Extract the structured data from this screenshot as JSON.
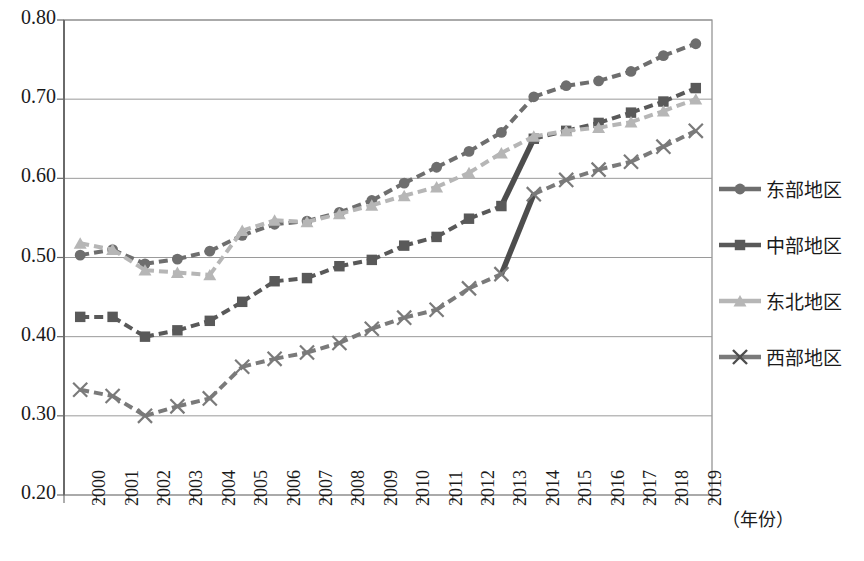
{
  "chart_data": {
    "type": "line",
    "title": "",
    "xlabel": "（年份）",
    "ylabel": "",
    "ylim": [
      0.2,
      0.8
    ],
    "ytick_step": 0.1,
    "grid": true,
    "legend_position": "right",
    "categories": [
      "2000",
      "2001",
      "2002",
      "2003",
      "2004",
      "2005",
      "2006",
      "2007",
      "2008",
      "2009",
      "2010",
      "2011",
      "2012",
      "2013",
      "2014",
      "2015",
      "2016",
      "2017",
      "2018",
      "2019"
    ],
    "ytick_labels": [
      "0.80",
      "0.70",
      "0.60",
      "0.50",
      "0.40",
      "0.30",
      "0.20"
    ],
    "series": [
      {
        "name": "东部地区",
        "marker": "circle",
        "color": "#6e6e6e",
        "line_style": "dashed",
        "values": [
          0.503,
          0.51,
          0.492,
          0.498,
          0.508,
          0.528,
          0.542,
          0.546,
          0.557,
          0.572,
          0.594,
          0.614,
          0.634,
          0.658,
          0.703,
          0.717,
          0.723,
          0.735,
          0.755,
          0.77
        ]
      },
      {
        "name": "中部地区",
        "marker": "square",
        "color": "#595959",
        "line_style": "dashed",
        "values": [
          0.425,
          0.425,
          0.4,
          0.408,
          0.42,
          0.444,
          0.47,
          0.474,
          0.489,
          0.497,
          0.515,
          0.526,
          0.549,
          0.565,
          0.65,
          0.66,
          0.67,
          0.683,
          0.697,
          0.714
        ]
      },
      {
        "name": "东北地区",
        "marker": "triangle",
        "color": "#b6b6b6",
        "line_style": "dashed",
        "values": [
          0.518,
          0.51,
          0.484,
          0.481,
          0.478,
          0.534,
          0.547,
          0.545,
          0.555,
          0.566,
          0.578,
          0.589,
          0.607,
          0.632,
          0.653,
          0.66,
          0.664,
          0.671,
          0.685,
          0.7
        ]
      },
      {
        "name": "西部地区",
        "marker": "cross",
        "color": "#7a7a7a",
        "line_style": "dashed",
        "values": [
          0.333,
          0.325,
          0.3,
          0.312,
          0.322,
          0.362,
          0.372,
          0.38,
          0.392,
          0.41,
          0.424,
          0.434,
          0.461,
          0.479,
          0.58,
          0.598,
          0.611,
          0.621,
          0.64,
          0.66
        ]
      }
    ],
    "annotations": [
      {
        "name": "mid-region-jump-2013-2014",
        "series": "中部地区",
        "from_year": "2013",
        "to_year": "2014",
        "style": "solid-thick"
      },
      {
        "name": "west-region-jump-2013-2014",
        "series": "西部地区",
        "from_year": "2013",
        "to_year": "2014",
        "style": "solid-thick"
      }
    ]
  },
  "legend": {
    "items": [
      {
        "label": "东部地区",
        "marker": "circle"
      },
      {
        "label": "中部地区",
        "marker": "square"
      },
      {
        "label": "东北地区",
        "marker": "triangle"
      },
      {
        "label": "西部地区",
        "marker": "cross"
      }
    ]
  }
}
